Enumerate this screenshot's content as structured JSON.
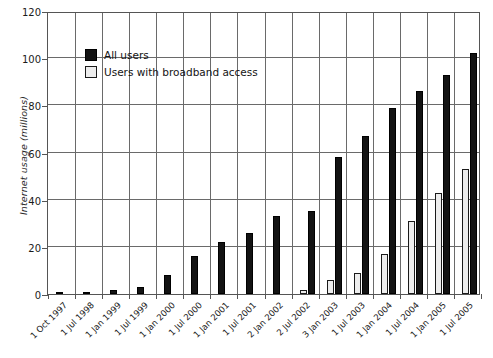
{
  "chart_data": {
    "type": "bar",
    "title": "",
    "xlabel": "",
    "ylabel": "Internet usage (millions)",
    "ylim": [
      0,
      120
    ],
    "yticks": [
      0,
      20,
      40,
      60,
      80,
      100,
      120
    ],
    "grid": "horizontal-and-vertical",
    "legend_position": "top-left-inside",
    "categories": [
      "1 Oct 1997",
      "1 Jul 1998",
      "1 Jan 1999",
      "1 Jul 1999",
      "1 Jan 2000",
      "1 Jul 2000",
      "1 Jan 2001",
      "1 Jul 2001",
      "2 Jan 2002",
      "2 Jul 2002",
      "3 Jan 2003",
      "1 Jul 2003",
      "1 Jan 2004",
      "1 Jul 2004",
      "1 Jan 2005",
      "1 Jul 2005"
    ],
    "series": [
      {
        "name": "Users with broadband access",
        "color": "#ededed",
        "values": [
          0,
          0,
          0,
          0,
          0,
          0,
          0,
          0,
          0,
          1.5,
          6,
          9,
          17,
          31,
          43,
          53
        ]
      },
      {
        "name": "All users",
        "color": "#131313",
        "values": [
          0.2,
          0.5,
          1.5,
          3,
          8,
          16,
          22,
          26,
          33,
          35,
          58,
          67,
          79,
          86,
          93,
          102
        ]
      }
    ]
  },
  "legend": {
    "items": [
      {
        "label": "All users",
        "swatch": "dark"
      },
      {
        "label": "Users with broadband access",
        "swatch": "light"
      }
    ]
  },
  "axis": {
    "y_title": "Internet usage (millions)"
  }
}
